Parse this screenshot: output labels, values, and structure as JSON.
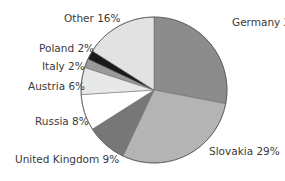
{
  "chart_data": {
    "type": "pie",
    "title": "",
    "start_angle_deg": 0,
    "direction": "clockwise",
    "slices": [
      {
        "label": "Germany",
        "value": 28,
        "text": "Germany 28%",
        "color": "#8c8c8c"
      },
      {
        "label": "Slovakia",
        "value": 29,
        "text": "Slovakia 29%",
        "color": "#b4b4b4"
      },
      {
        "label": "United Kingdom",
        "value": 9,
        "text": "United Kingdom  9%",
        "color": "#777777"
      },
      {
        "label": "Russia",
        "value": 8,
        "text": "Russia 8%",
        "color": "#ffffff"
      },
      {
        "label": "Austria",
        "value": 6,
        "text": "Austria 6%",
        "color": "#e8e8e8"
      },
      {
        "label": "Italy",
        "value": 2,
        "text": "Italy 2%",
        "color": "#9a9a9a"
      },
      {
        "label": "Poland",
        "value": 2,
        "text": "Poland 2%",
        "color": "#1a1a1a"
      },
      {
        "label": "Other",
        "value": 16,
        "text": "Other 16%",
        "color": "#e2e2e2"
      }
    ],
    "categories": [
      "Germany",
      "Slovakia",
      "United Kingdom",
      "Russia",
      "Austria",
      "Italy",
      "Poland",
      "Other"
    ],
    "values": [
      28,
      29,
      9,
      8,
      6,
      2,
      2,
      16
    ],
    "legend": "none (direct labels)"
  },
  "layout": {
    "cx": 154,
    "cy": 90,
    "r": 73,
    "labels": [
      {
        "x": 232,
        "y": 16
      },
      {
        "x": 209,
        "y": 145
      },
      {
        "x": 15,
        "y": 153
      },
      {
        "x": 35,
        "y": 115
      },
      {
        "x": 28,
        "y": 80
      },
      {
        "x": 42,
        "y": 60
      },
      {
        "x": 39,
        "y": 42
      },
      {
        "x": 64,
        "y": 12
      }
    ]
  }
}
